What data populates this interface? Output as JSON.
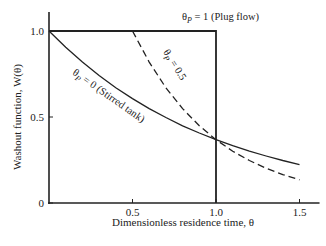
{
  "chart_data": {
    "type": "line",
    "title": "",
    "xlabel": "Dimensionless residence time, θ",
    "ylabel": "Washout function, W(θ)",
    "xlim": [
      0,
      1.6
    ],
    "ylim": [
      0,
      1.1
    ],
    "x_ticks": [
      "0.5",
      "1.0",
      "1.5"
    ],
    "x_tick_values": [
      0.5,
      1.0,
      1.5
    ],
    "y_ticks": [
      "0",
      "0.5",
      "1.0"
    ],
    "y_tick_values": [
      0,
      0.5,
      1.0
    ],
    "grid": false,
    "series": [
      {
        "name": "θp = 0 (Stirred tank)",
        "style": "solid",
        "x": [
          0,
          0.1,
          0.2,
          0.3,
          0.4,
          0.5,
          0.6,
          0.7,
          0.8,
          0.9,
          1.0,
          1.1,
          1.2,
          1.3,
          1.4,
          1.5
        ],
        "y": [
          1.0,
          0.905,
          0.819,
          0.741,
          0.67,
          0.607,
          0.549,
          0.497,
          0.449,
          0.407,
          0.368,
          0.333,
          0.301,
          0.273,
          0.247,
          0.223
        ]
      },
      {
        "name": "θp = 0.5",
        "style": "dashed",
        "x": [
          0.5,
          0.6,
          0.7,
          0.8,
          0.9,
          1.0,
          1.1,
          1.2,
          1.3,
          1.4,
          1.5
        ],
        "y": [
          1.0,
          0.819,
          0.67,
          0.549,
          0.449,
          0.368,
          0.301,
          0.247,
          0.202,
          0.165,
          0.135
        ]
      },
      {
        "name": "θp = 1 (Plug flow)",
        "style": "solid",
        "x": [
          0,
          1.0,
          1.0
        ],
        "y": [
          1.0,
          1.0,
          0
        ]
      }
    ],
    "annotations": [
      {
        "text": "θp = 1 (Plug flow)",
        "x": 1.2,
        "y": 1.08
      },
      {
        "text": "θp = 0.5",
        "x": 0.6,
        "y": 0.9
      },
      {
        "text": "θp = 0 (Stirred tank)",
        "x": 0.35,
        "y": 0.62
      }
    ]
  },
  "labels": {
    "plug": "θ",
    "plug_sub": "P",
    "plug_rest": " = 1 (Plug flow)",
    "half": "θ",
    "half_sub": "P",
    "half_rest": " = 0.5",
    "stirred": "θ",
    "stirred_sub": "P",
    "stirred_rest": " = 0 (Stirred tank)"
  }
}
